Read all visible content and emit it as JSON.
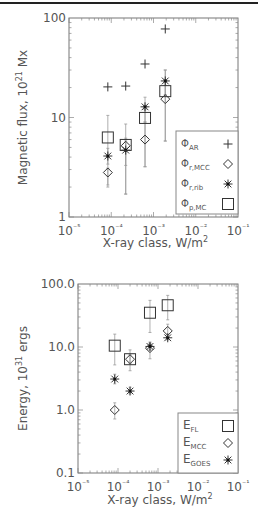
{
  "figure": {
    "top_rule_color": "#222222"
  },
  "chart_data": [
    {
      "type": "scatter",
      "title": "",
      "xlabel": "X-ray class, W/m²",
      "ylabel": "Magnetic flux, 10²¹ Mx",
      "xscale": "log",
      "yscale": "log",
      "xlim": [
        1e-05,
        0.1
      ],
      "ylim": [
        1,
        100
      ],
      "xticks": [
        "10⁻⁵",
        "10⁻⁴",
        "10⁻³",
        "10⁻²",
        "10⁻¹"
      ],
      "yticks": [
        "1",
        "10",
        "100"
      ],
      "grid": false,
      "legend_position": "lower right",
      "x": [
        8.3e-05,
        0.00022,
        0.00063,
        0.0019
      ],
      "series": [
        {
          "name": "ΦAR",
          "label_main": "Φ",
          "label_sub": "AR",
          "marker": "plus",
          "values": [
            20.3,
            20.7,
            34.5,
            77.6
          ],
          "err_low": [
            null,
            null,
            null,
            null
          ],
          "err_high": [
            null,
            null,
            null,
            null
          ]
        },
        {
          "name": "Φr,MCC",
          "label_main": "Φ",
          "label_sub": "r,MCC",
          "marker": "diamond",
          "values": [
            2.8,
            5.2,
            6.0,
            15.3
          ],
          "err_low": [
            2.0,
            1.7,
            3.2,
            5.8
          ],
          "err_high": [
            3.1,
            5.8,
            9.0,
            30.0
          ]
        },
        {
          "name": "Φr,rib",
          "label_main": "Φ",
          "label_sub": "r,rib",
          "marker": "asterisk",
          "values": [
            4.1,
            4.7,
            12.8,
            23.3
          ],
          "err_low": [
            3.4,
            3.3,
            9.0,
            17.0
          ],
          "err_high": [
            4.9,
            6.2,
            16.0,
            30.0
          ]
        },
        {
          "name": "Φp,MC",
          "label_main": "Φ",
          "label_sub": "p,MC",
          "marker": "square",
          "values": [
            6.3,
            5.3,
            9.9,
            18.4
          ],
          "err_low": [
            2.1,
            1.7,
            3.2,
            5.8
          ],
          "err_high": [
            10.5,
            8.6,
            12.0,
            21.0
          ]
        }
      ]
    },
    {
      "type": "scatter",
      "title": "",
      "xlabel": "X-ray class, W/m²",
      "ylabel": "Energy, 10³¹ ergs",
      "xscale": "log",
      "yscale": "log",
      "xlim": [
        1e-05,
        0.1
      ],
      "ylim": [
        0.1,
        100
      ],
      "xticks": [
        "10⁻⁵",
        "10⁻⁴",
        "10⁻³",
        "10⁻²",
        "10⁻¹"
      ],
      "yticks": [
        "0.1",
        "1.0",
        "10.0",
        "100.0"
      ],
      "grid": false,
      "legend_position": "lower right",
      "x": [
        8.3e-05,
        0.0002,
        0.00063,
        0.00175
      ],
      "series": [
        {
          "name": "EFL",
          "label_main": "E",
          "label_sub": "FL",
          "marker": "square",
          "values": [
            10.5,
            6.4,
            35.0,
            46.0
          ],
          "err_low": [
            5.2,
            4.2,
            17.0,
            27.0
          ],
          "err_high": [
            16.0,
            9.0,
            55.0,
            66.0
          ]
        },
        {
          "name": "EMCC",
          "label_main": "E",
          "label_sub": "MCC",
          "marker": "diamond",
          "values": [
            1.0,
            6.4,
            9.6,
            18.0
          ],
          "err_low": [
            0.72,
            5.5,
            6.5,
            14.0
          ],
          "err_high": [
            1.3,
            7.5,
            12.0,
            23.0
          ]
        },
        {
          "name": "EGOES",
          "label_main": "E",
          "label_sub": "GOES",
          "marker": "asterisk",
          "values": [
            3.1,
            2.0,
            10.2,
            14.0
          ],
          "err_low": [
            2.6,
            1.8,
            9.0,
            13.0
          ],
          "err_high": [
            3.7,
            2.3,
            11.5,
            15.5
          ]
        }
      ]
    }
  ],
  "panels": [
    {
      "ylabel_main": "Magnetic flux, 10",
      "ylabel_sup": "21",
      "ylabel_tail": " Mx",
      "xlabel_main": "X-ray class, W/m",
      "xlabel_sup": "2"
    },
    {
      "ylabel_main": "Energy, 10",
      "ylabel_sup": "31",
      "ylabel_tail": " ergs",
      "xlabel_main": "X-ray class, W/m",
      "xlabel_sup": "2"
    }
  ]
}
